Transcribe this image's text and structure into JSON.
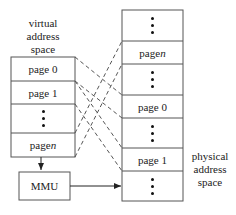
{
  "virtual": {
    "label": [
      "virtual",
      "address",
      "space"
    ],
    "pages": [
      {
        "type": "page",
        "label": "page 0"
      },
      {
        "type": "page",
        "label": "page 1"
      },
      {
        "type": "dots"
      },
      {
        "type": "page",
        "label": "page ",
        "var": "n"
      }
    ]
  },
  "physical": {
    "label": [
      "physical",
      "address",
      "space"
    ],
    "pages": [
      {
        "type": "dots"
      },
      {
        "type": "page",
        "label": "page ",
        "var": "n"
      },
      {
        "type": "dots"
      },
      {
        "type": "page",
        "label": "page 0"
      },
      {
        "type": "dots"
      },
      {
        "type": "page",
        "label": "page 1"
      },
      {
        "type": "dots"
      }
    ]
  },
  "mmu": {
    "label": "MMU"
  },
  "mappings": [
    {
      "from": "page 0",
      "to": "page 0"
    },
    {
      "from": "page 1",
      "to": "page 1"
    },
    {
      "from": "page n",
      "to": "page n"
    }
  ]
}
